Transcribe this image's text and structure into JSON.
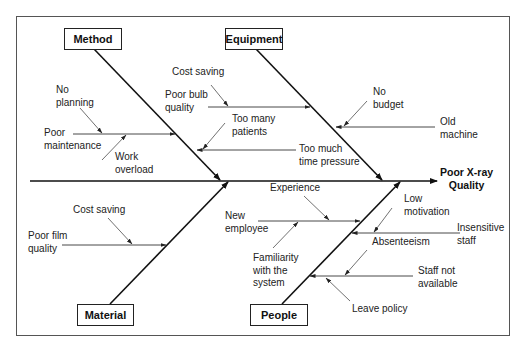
{
  "diagram": {
    "type": "fishbone",
    "effect": "Poor X-ray\nQuality",
    "categories": {
      "method": "Method",
      "equipment": "Equipment",
      "material": "Material",
      "people": "People"
    },
    "causes": {
      "method": {
        "poor_maintenance": "Poor\nmaintenance",
        "no_planning": "No\nplanning",
        "work_overload": "Work\noverload"
      },
      "equipment": {
        "cost_saving": "Cost saving",
        "poor_bulb_quality": "Poor bulb\nquality",
        "too_many_patients": "Too many\npatients",
        "too_much_time_pressure": "Too much\ntime pressure",
        "no_budget": "No\nbudget",
        "old_machine": "Old\nmachine"
      },
      "material": {
        "cost_saving": "Cost saving",
        "poor_film_quality": "Poor film\nquality"
      },
      "people": {
        "experience": "Experience",
        "new_employee": "New\nemployee",
        "familiarity": "Familiarity\nwith the\nsystem",
        "low_motivation": "Low\nmotivation",
        "insensitive_staff": "Insensitive\nstaff",
        "absenteeism": "Absenteeism",
        "staff_not_available": "Staff not\navailable",
        "leave_policy": "Leave policy"
      }
    },
    "colors": {
      "line": "#1a1a1a",
      "thin_line": "#333333",
      "text": "#222222"
    }
  }
}
